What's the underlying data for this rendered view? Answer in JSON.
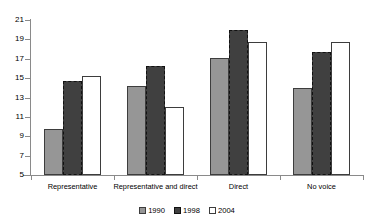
{
  "chart_data": {
    "type": "bar",
    "title": "",
    "subtitle": "",
    "xlabel": "",
    "ylabel": "",
    "ylim": [
      5,
      21
    ],
    "yticks": [
      5,
      7,
      9,
      11,
      13,
      15,
      17,
      19,
      21
    ],
    "ytick_labels": [
      "5",
      "7",
      "9",
      "11",
      "13",
      "15",
      "17",
      "19",
      "21"
    ],
    "grid": false,
    "legend_position": "bottom",
    "categories": [
      "Representative",
      "Representative and direct",
      "Direct",
      "No voice"
    ],
    "series": [
      {
        "name": "1990",
        "color": "#969696",
        "values": [
          9.8,
          14.2,
          17.1,
          14.0
        ]
      },
      {
        "name": "1998",
        "color": "#404040",
        "values": [
          14.7,
          16.3,
          20.0,
          17.7
        ]
      },
      {
        "name": "2004",
        "color": "#ffffff",
        "values": [
          15.2,
          12.0,
          18.7,
          18.7
        ]
      }
    ],
    "annotations": []
  },
  "legend": {
    "items": [
      {
        "label": "1990",
        "swatch": "legend-swatch-1990"
      },
      {
        "label": "1998",
        "swatch": "legend-swatch-1998"
      },
      {
        "label": "2004",
        "swatch": "legend-swatch-2004"
      }
    ]
  },
  "colors": {
    "series_1990": "#969696",
    "series_1998": "#404040",
    "series_2004": "#ffffff",
    "axis": "#8a8a8a",
    "bar_outline": "#3d3d3d",
    "background": "#ffffff"
  }
}
